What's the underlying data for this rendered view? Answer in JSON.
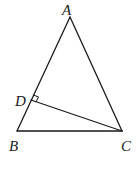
{
  "diagram": {
    "type": "geometry-triangle",
    "points": {
      "A": {
        "label": "A",
        "x": 70,
        "y": 17
      },
      "B": {
        "label": "B",
        "x": 17,
        "y": 131
      },
      "C": {
        "label": "C",
        "x": 122,
        "y": 131
      },
      "D": {
        "label": "D",
        "x": 31,
        "y": 100
      }
    },
    "segments": [
      "AB",
      "AC",
      "BC",
      "CD"
    ],
    "annotations": [
      {
        "type": "right-angle",
        "at": "D",
        "between": [
          "DA",
          "DC"
        ]
      }
    ],
    "line_color": "#1a1a1a"
  }
}
